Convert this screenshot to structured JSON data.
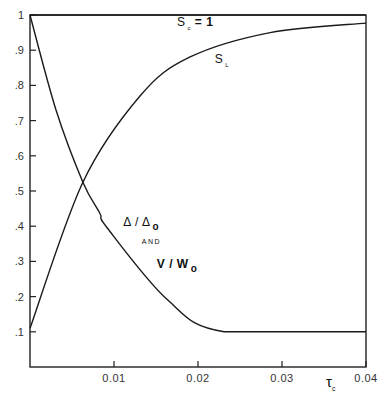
{
  "chart_data": {
    "type": "line",
    "title": "",
    "xlabel": "τ_c",
    "ylabel": "",
    "xlim": [
      0,
      0.04
    ],
    "ylim": [
      0,
      1
    ],
    "grid": false,
    "x_ticks": [
      0.01,
      0.02,
      0.03,
      0.04
    ],
    "x_tick_labels": [
      "0.01",
      "0.02",
      "0.03",
      "0.04"
    ],
    "y_ticks": [
      0.1,
      0.2,
      0.3,
      0.4,
      0.5,
      0.6,
      0.7,
      0.8,
      0.9,
      1.0
    ],
    "y_tick_labels": [
      ".1",
      ".2",
      ".3",
      ".4",
      ".5",
      ".6",
      ".7",
      ".8",
      ".9",
      "1"
    ],
    "series": [
      {
        "name": "S_c = 1",
        "x": [
          0,
          0.04
        ],
        "y": [
          1.0,
          1.0
        ]
      },
      {
        "name": "S_L",
        "x": [
          0,
          0.0063,
          0.0131,
          0.019,
          0.0286,
          0.04
        ],
        "y": [
          0.11,
          0.525,
          0.77,
          0.88,
          0.95,
          0.977
        ]
      },
      {
        "name": "Δ/Δo and V/Wo",
        "x": [
          0,
          0.0031,
          0.0063,
          0.0083,
          0.0092,
          0.0164,
          0.0231,
          0.04
        ],
        "y": [
          1.0,
          0.73,
          0.525,
          0.4375,
          0.395,
          0.19,
          0.1,
          0.1
        ]
      }
    ],
    "annotations": [
      {
        "text_main": "S",
        "text_sub": "c",
        "text_rest": " =  1",
        "x": 0.0175,
        "y": 0.97
      },
      {
        "text_main": "S",
        "text_sub": "L",
        "x": 0.022,
        "y": 0.865
      },
      {
        "text_main": "Δ / Δ",
        "text_sub": "o",
        "x": 0.0111,
        "y": 0.4
      },
      {
        "text_main": "AND",
        "x": 0.0133,
        "y": 0.35
      },
      {
        "text_main": "V / W",
        "text_sub": "o",
        "x": 0.0151,
        "y": 0.28
      }
    ]
  }
}
